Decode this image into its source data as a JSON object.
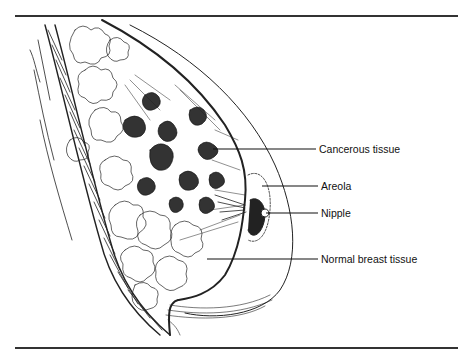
{
  "figure": {
    "labels": [
      {
        "id": "cancerous",
        "text": "Cancerous tissue",
        "x": 319,
        "y": 143,
        "line": {
          "x1": 213,
          "x2": 316,
          "y": 149
        }
      },
      {
        "id": "areola",
        "text": "Areola",
        "x": 321,
        "y": 180,
        "line": {
          "x1": 262,
          "x2": 318,
          "y": 186
        }
      },
      {
        "id": "nipple",
        "text": "Nipple",
        "x": 321,
        "y": 207,
        "line": {
          "x1": 266,
          "x2": 318,
          "y": 213
        }
      },
      {
        "id": "normal",
        "text": "Normal breast tissue",
        "x": 321,
        "y": 253,
        "line": {
          "x1": 207,
          "x2": 318,
          "y": 259
        }
      }
    ],
    "colors": {
      "ink": "#222222",
      "background": "#ffffff"
    }
  }
}
